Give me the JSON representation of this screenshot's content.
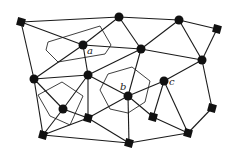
{
  "diagram": {
    "width": 237,
    "height": 153,
    "colors": {
      "stroke": "#1a1a1a",
      "node": "#111111",
      "background": "#ffffff"
    },
    "nodes": [
      {
        "id": "n1",
        "shape": "square",
        "x": 21,
        "y": 22
      },
      {
        "id": "n2",
        "shape": "circle",
        "x": 119,
        "y": 17
      },
      {
        "id": "n3",
        "shape": "circle",
        "x": 179,
        "y": 20
      },
      {
        "id": "n4",
        "shape": "square",
        "x": 217,
        "y": 29
      },
      {
        "id": "a",
        "shape": "circle",
        "x": 83,
        "y": 45,
        "label": "a"
      },
      {
        "id": "n6",
        "shape": "circle",
        "x": 141,
        "y": 49
      },
      {
        "id": "n7",
        "shape": "circle",
        "x": 202,
        "y": 60
      },
      {
        "id": "n8",
        "shape": "circle",
        "x": 34,
        "y": 79
      },
      {
        "id": "n9",
        "shape": "circle",
        "x": 88,
        "y": 75
      },
      {
        "id": "b",
        "shape": "circle",
        "x": 128,
        "y": 96,
        "label": "b"
      },
      {
        "id": "c",
        "shape": "circle",
        "x": 164,
        "y": 81,
        "label": "c"
      },
      {
        "id": "n12",
        "shape": "circle",
        "x": 63,
        "y": 109
      },
      {
        "id": "n13",
        "shape": "square",
        "x": 88,
        "y": 118
      },
      {
        "id": "n14",
        "shape": "square",
        "x": 153,
        "y": 117
      },
      {
        "id": "n15",
        "shape": "square",
        "x": 212,
        "y": 108
      },
      {
        "id": "n16",
        "shape": "square",
        "x": 43,
        "y": 135
      },
      {
        "id": "n17",
        "shape": "square",
        "x": 188,
        "y": 133
      },
      {
        "id": "n18",
        "shape": "square",
        "x": 129,
        "y": 143
      }
    ],
    "edges": [
      [
        "n1",
        "n2"
      ],
      [
        "n2",
        "n3"
      ],
      [
        "n3",
        "n4"
      ],
      [
        "n1",
        "a"
      ],
      [
        "n1",
        "n8"
      ],
      [
        "n2",
        "n6"
      ],
      [
        "n2",
        "a"
      ],
      [
        "n3",
        "n6"
      ],
      [
        "n3",
        "n7"
      ],
      [
        "n4",
        "n7"
      ],
      [
        "a",
        "n6"
      ],
      [
        "a",
        "n8"
      ],
      [
        "a",
        "n9"
      ],
      [
        "n6",
        "n7"
      ],
      [
        "n6",
        "n9"
      ],
      [
        "n6",
        "b"
      ],
      [
        "n7",
        "c"
      ],
      [
        "n7",
        "n15"
      ],
      [
        "n8",
        "n9"
      ],
      [
        "n8",
        "n12"
      ],
      [
        "n8",
        "n16"
      ],
      [
        "n9",
        "n12"
      ],
      [
        "n9",
        "n13"
      ],
      [
        "n9",
        "b"
      ],
      [
        "b",
        "c"
      ],
      [
        "b",
        "n13"
      ],
      [
        "b",
        "n14"
      ],
      [
        "b",
        "n18"
      ],
      [
        "c",
        "n14"
      ],
      [
        "c",
        "n17"
      ],
      [
        "n12",
        "n16"
      ],
      [
        "n12",
        "n13"
      ],
      [
        "n13",
        "n16"
      ],
      [
        "n13",
        "n18"
      ],
      [
        "n14",
        "n17"
      ],
      [
        "n16",
        "n18"
      ],
      [
        "n18",
        "n17"
      ],
      [
        "n17",
        "n15"
      ]
    ],
    "cells": [
      {
        "id": "cell-a",
        "points": "48,42 100,26 111,45 105,54 58,62 46,50"
      },
      {
        "id": "cell-b",
        "points": "108,74 132,67 150,81 145,102 128,113 110,109 100,90"
      },
      {
        "id": "cell-n12",
        "points": "38,95 62,82 83,96 70,125 50,116"
      }
    ],
    "labels": [
      {
        "id": "label-a",
        "text": "a",
        "x": 87,
        "y": 46
      },
      {
        "id": "label-b",
        "text": "b",
        "x": 120,
        "y": 82
      },
      {
        "id": "label-c",
        "text": "c",
        "x": 169,
        "y": 77
      }
    ]
  }
}
